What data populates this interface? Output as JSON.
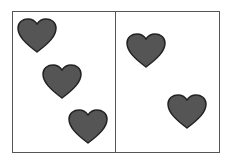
{
  "figure": {
    "panels": [
      {
        "name": "left",
        "heart_count": 3
      },
      {
        "name": "right",
        "heart_count": 2
      }
    ],
    "heart_color": "#555555",
    "heart_outline": "#222222",
    "hearts": [
      {
        "panel": "left",
        "x": 17,
        "y": 18
      },
      {
        "panel": "left",
        "x": 42,
        "y": 64
      },
      {
        "panel": "left",
        "x": 68,
        "y": 109
      },
      {
        "panel": "right",
        "x": 126,
        "y": 33
      },
      {
        "panel": "right",
        "x": 167,
        "y": 94
      }
    ]
  }
}
